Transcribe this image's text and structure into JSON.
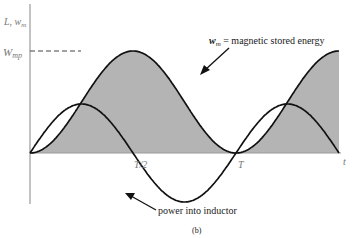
{
  "figure": {
    "caption": "(b)",
    "y_axis_label": {
      "base": "L",
      "sep": ", ",
      "main": "w",
      "sub": "m"
    },
    "x_axis_label": "t",
    "peak_label": {
      "main": "W",
      "sub": "mp"
    },
    "tick_labels": [
      "T/2",
      "T"
    ],
    "annotations": {
      "energy": {
        "main": "w",
        "sub": "m",
        "text": " = magnetic stored energy"
      },
      "power": "power into inductor"
    },
    "colors": {
      "fill": "#b4b4b4",
      "stroke": "#111111",
      "axis": "#9a9a9a"
    }
  },
  "chart_data": {
    "type": "line",
    "title": "",
    "xlabel": "t",
    "ylabel": "L, w_m",
    "x_ticks": [
      "T/2",
      "T"
    ],
    "y_ticks": [
      "W_mp"
    ],
    "series": [
      {
        "name": "w_m = magnetic stored energy",
        "shape": "W_mp * sin^2(ωt)",
        "filled": true,
        "periods_shown": 3,
        "min": 0,
        "max": "W_mp"
      },
      {
        "name": "power into inductor",
        "shape": "sin(2ωt)",
        "filled": false,
        "periods_shown": 3,
        "min": -1,
        "max": 1
      }
    ],
    "x_range": [
      0,
      "1.5T"
    ],
    "grid": false
  }
}
